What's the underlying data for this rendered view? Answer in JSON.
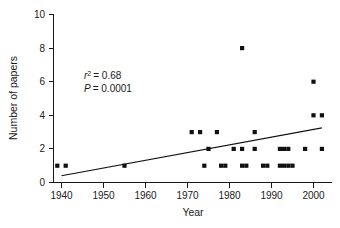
{
  "chart_data": {
    "type": "scatter",
    "title": "",
    "xlabel": "Year",
    "ylabel": "Number of papers",
    "xlim": [
      1935,
      2004
    ],
    "ylim": [
      0,
      10
    ],
    "xticks": [
      1940,
      1950,
      1960,
      1970,
      1980,
      1990,
      2000
    ],
    "xticklabels": [
      "1940",
      "1950",
      "1960",
      "1970",
      "1980",
      "1990",
      "2000"
    ],
    "yticks": [
      0,
      2,
      4,
      6,
      8,
      10
    ],
    "yticklabels": [
      "0",
      "2",
      "4",
      "6",
      "8",
      "10"
    ],
    "grid": false,
    "legend": null,
    "marker": "square",
    "marker_color": "#111111",
    "points": [
      {
        "x": 1939,
        "y": 1
      },
      {
        "x": 1941,
        "y": 1
      },
      {
        "x": 1955,
        "y": 1
      },
      {
        "x": 1971,
        "y": 3
      },
      {
        "x": 1973,
        "y": 3
      },
      {
        "x": 1974,
        "y": 1
      },
      {
        "x": 1975,
        "y": 2
      },
      {
        "x": 1977,
        "y": 3
      },
      {
        "x": 1978,
        "y": 1
      },
      {
        "x": 1979,
        "y": 1
      },
      {
        "x": 1981,
        "y": 2
      },
      {
        "x": 1983,
        "y": 8
      },
      {
        "x": 1983,
        "y": 2
      },
      {
        "x": 1983,
        "y": 1
      },
      {
        "x": 1984,
        "y": 1
      },
      {
        "x": 1986,
        "y": 2
      },
      {
        "x": 1986,
        "y": 3
      },
      {
        "x": 1988,
        "y": 1
      },
      {
        "x": 1989,
        "y": 1
      },
      {
        "x": 1992,
        "y": 2
      },
      {
        "x": 1993,
        "y": 2
      },
      {
        "x": 1994,
        "y": 2
      },
      {
        "x": 1992,
        "y": 1
      },
      {
        "x": 1993,
        "y": 1
      },
      {
        "x": 1994,
        "y": 1
      },
      {
        "x": 1995,
        "y": 1
      },
      {
        "x": 1998,
        "y": 2
      },
      {
        "x": 2000,
        "y": 6
      },
      {
        "x": 2000,
        "y": 4
      },
      {
        "x": 2002,
        "y": 4
      },
      {
        "x": 2002,
        "y": 2
      }
    ],
    "fit_line": {
      "x0": 1940,
      "y0": 0.4,
      "x1": 2002,
      "y1": 3.25
    },
    "annotations": {
      "r_squared_var": "r",
      "r_squared_sup": "2",
      "r_squared_value": "= 0.68",
      "p_var": "P",
      "p_value": "= 0.0001"
    }
  }
}
